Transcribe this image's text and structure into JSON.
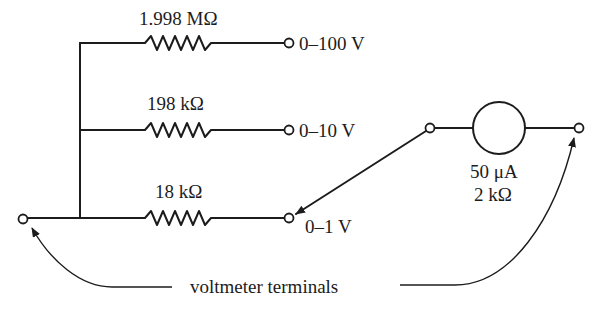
{
  "diagram": {
    "type": "multi-range voltmeter circuit",
    "resistors": [
      {
        "label": "1.998 MΩ",
        "range": "0–100 V"
      },
      {
        "label": "198 kΩ",
        "range": "0–10 V"
      },
      {
        "label": "18 kΩ",
        "range": "0–1 V"
      }
    ],
    "meter": {
      "current_label": "50 μA",
      "resistance_label": "2 kΩ"
    },
    "caption": "voltmeter terminals",
    "colors": {
      "ink": "#1c1c1c",
      "background": "#ffffff"
    }
  }
}
